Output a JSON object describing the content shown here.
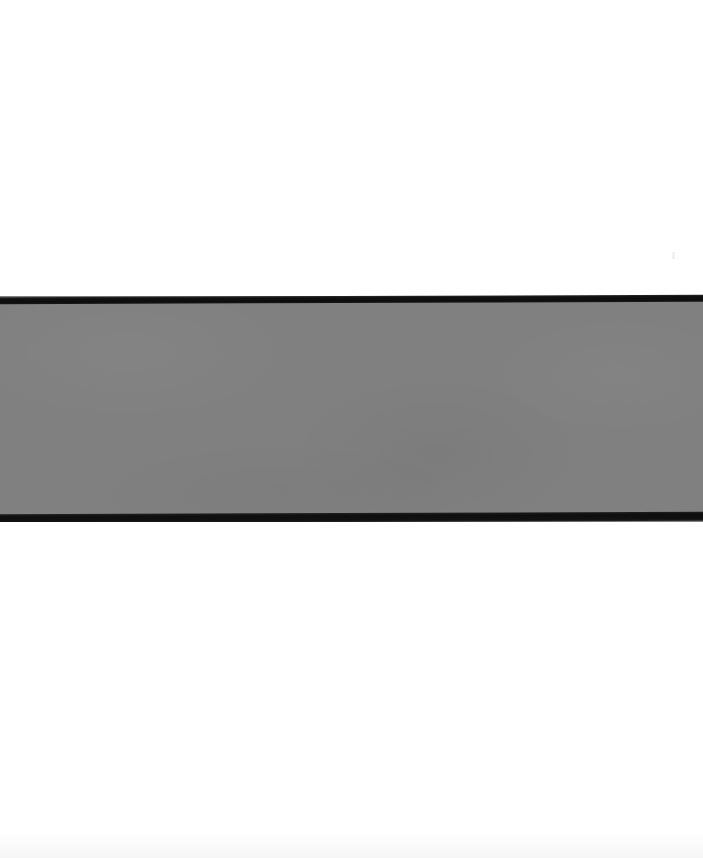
{
  "page": {
    "width": 703,
    "height": 858,
    "background_color": "#ffffff"
  },
  "band": {
    "top": 296,
    "bottom": 522,
    "height": 226,
    "fill_color": "#808080",
    "spans_full_width": true
  },
  "rules": [
    {
      "name": "top-rule",
      "y": 296,
      "thickness": 7,
      "color": "#101010",
      "tilt_degrees": -0.22
    },
    {
      "name": "bottom-rule",
      "y": 513,
      "thickness": 9,
      "color": "#0e0e0e",
      "tilt_degrees": -0.22
    }
  ],
  "white_regions": [
    {
      "name": "upper-margin",
      "top": 0,
      "height": 296,
      "color": "#ffffff"
    },
    {
      "name": "lower-margin",
      "top": 522,
      "height": 336,
      "color": "#ffffff"
    }
  ],
  "artifacts": {
    "note": "Faint scanner noise and paper tone variation; no legible text present.",
    "marks": [
      {
        "name": "mark-upper-right",
        "x": 672,
        "y": 252,
        "width": 3,
        "height": 7
      },
      {
        "name": "mark-lower-left",
        "x": 12,
        "y": 612,
        "width": 4,
        "height": 5
      },
      {
        "name": "mark-lower-center",
        "x": 318,
        "y": 678,
        "width": 3,
        "height": 3
      },
      {
        "name": "mark-lower-mid",
        "x": 412,
        "y": 580,
        "width": 3,
        "height": 6
      },
      {
        "name": "mark-bottom-edge",
        "x": 596,
        "y": 722,
        "width": 3,
        "height": 4
      }
    ]
  }
}
